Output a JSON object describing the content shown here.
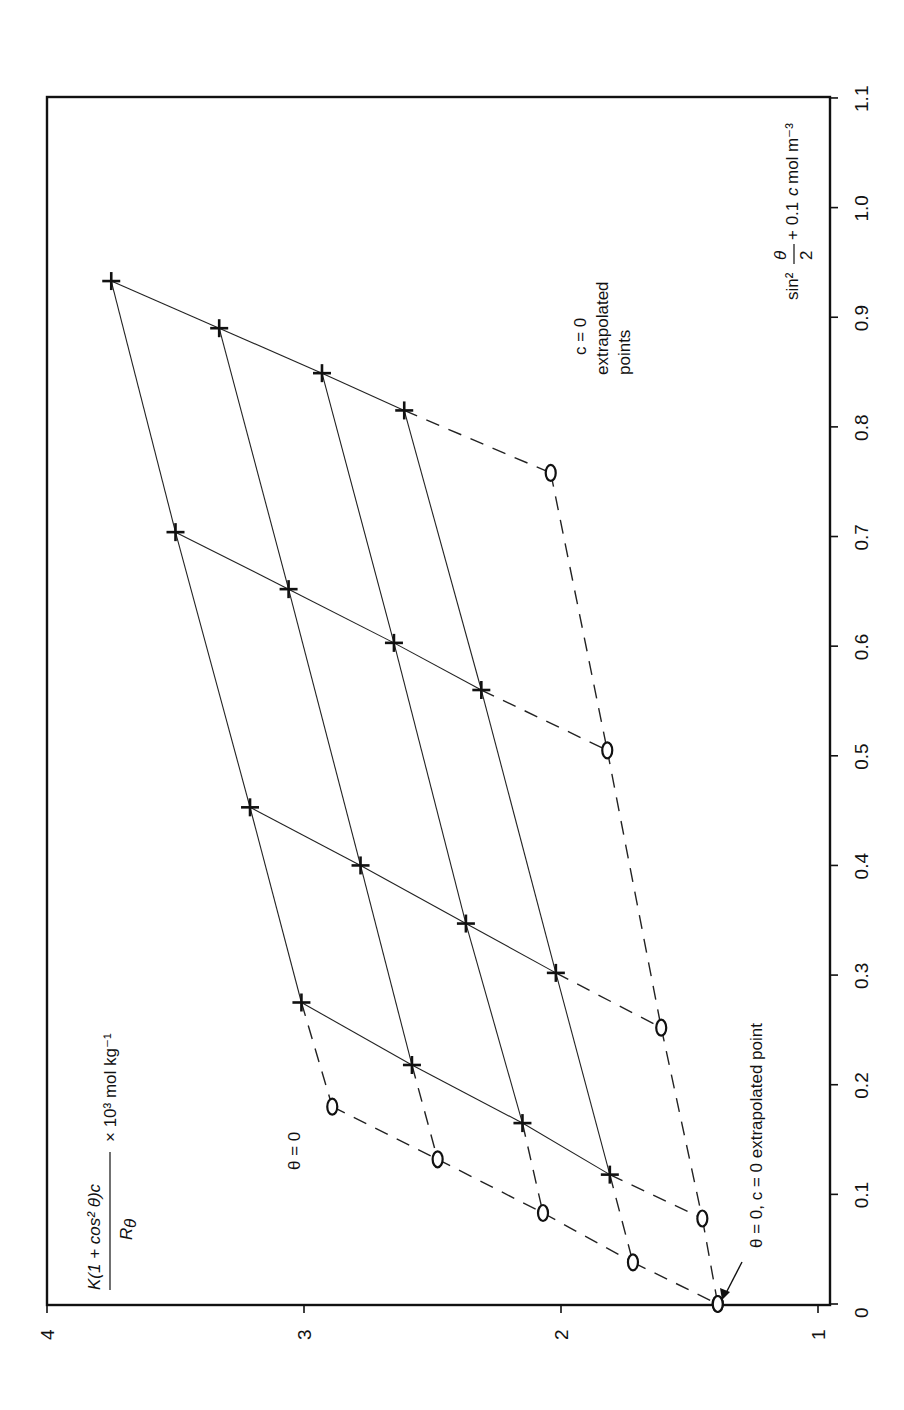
{
  "chart_data": {
    "type": "scatter",
    "subtype": "zimm_plot",
    "orientation": "rotated_90_ccw",
    "title": "",
    "xlabel": "sin² θ/2 + 0.1c mol m⁻³",
    "ylabel": "K(1 + cos² θ)c / Rθ × 10³ mol kg⁻¹",
    "xlim": [
      0,
      1.1
    ],
    "ylim": [
      1,
      4
    ],
    "x_ticks": [
      "0",
      "0.1",
      "0.2",
      "0.3",
      "0.4",
      "0.5",
      "0.6",
      "0.7",
      "0.8",
      "0.9",
      "1.0",
      "1.1"
    ],
    "y_ticks": [
      "1",
      "2",
      "3",
      "4"
    ],
    "grid": false,
    "annotations": [
      {
        "text": "θ = 0",
        "near": "theta0_line"
      },
      {
        "text": "c = 0",
        "near": "c0_line"
      },
      {
        "text": "extrapolated",
        "near": "c0_line"
      },
      {
        "text": "points",
        "near": "c0_line"
      },
      {
        "text": "θ = 0, c = 0 extrapolated point",
        "near": "origin",
        "arrow": true
      }
    ],
    "series": [
      {
        "name": "measured",
        "marker": "+",
        "line": "solid",
        "points": [
          {
            "x": 0.933,
            "y": 3.75
          },
          {
            "x": 0.89,
            "y": 3.33
          },
          {
            "x": 0.849,
            "y": 2.93
          },
          {
            "x": 0.815,
            "y": 2.61
          },
          {
            "x": 0.704,
            "y": 3.5
          },
          {
            "x": 0.652,
            "y": 3.06
          },
          {
            "x": 0.603,
            "y": 2.65
          },
          {
            "x": 0.56,
            "y": 2.31
          },
          {
            "x": 0.453,
            "y": 3.21
          },
          {
            "x": 0.4,
            "y": 2.78
          },
          {
            "x": 0.347,
            "y": 2.37
          },
          {
            "x": 0.302,
            "y": 2.02
          },
          {
            "x": 0.275,
            "y": 3.01
          },
          {
            "x": 0.218,
            "y": 2.58
          },
          {
            "x": 0.165,
            "y": 2.15
          },
          {
            "x": 0.118,
            "y": 1.81
          }
        ]
      },
      {
        "name": "c = 0 extrapolated points",
        "marker": "o",
        "line": "dashed",
        "points": [
          {
            "x": 0.758,
            "y": 2.04
          },
          {
            "x": 0.505,
            "y": 1.82
          },
          {
            "x": 0.252,
            "y": 1.61
          },
          {
            "x": 0.078,
            "y": 1.45
          },
          {
            "x": 0.0,
            "y": 1.39
          }
        ]
      },
      {
        "name": "θ = 0 extrapolated points",
        "marker": "o",
        "line": "dashed",
        "points": [
          {
            "x": 0.18,
            "y": 2.89
          },
          {
            "x": 0.132,
            "y": 2.48
          },
          {
            "x": 0.083,
            "y": 2.07
          },
          {
            "x": 0.038,
            "y": 1.72
          },
          {
            "x": 0.0,
            "y": 1.39
          }
        ]
      }
    ]
  },
  "labels": {
    "theta0": "θ = 0",
    "c0": "c = 0",
    "extrapolated": "extrapolated",
    "points": "points",
    "origin_note": "θ = 0, c = 0 extrapolated point"
  }
}
